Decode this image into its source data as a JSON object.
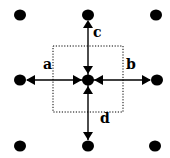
{
  "diagram": {
    "labels": {
      "left": "a",
      "right": "b",
      "top": "c",
      "bottom": "d"
    },
    "nodes": [
      {
        "id": "top-left"
      },
      {
        "id": "top-center"
      },
      {
        "id": "top-right"
      },
      {
        "id": "middle-left"
      },
      {
        "id": "center"
      },
      {
        "id": "middle-right"
      },
      {
        "id": "bottom-left"
      },
      {
        "id": "bottom-center"
      },
      {
        "id": "bottom-right"
      }
    ],
    "edges": [
      {
        "from": "center",
        "to": "top-center",
        "label": "c"
      },
      {
        "from": "center",
        "to": "middle-left",
        "label": "a"
      },
      {
        "from": "center",
        "to": "middle-right",
        "label": "b"
      },
      {
        "from": "center",
        "to": "bottom-center",
        "label": "d"
      }
    ],
    "colors": {
      "ink": "#000000",
      "background": "#ffffff"
    }
  }
}
